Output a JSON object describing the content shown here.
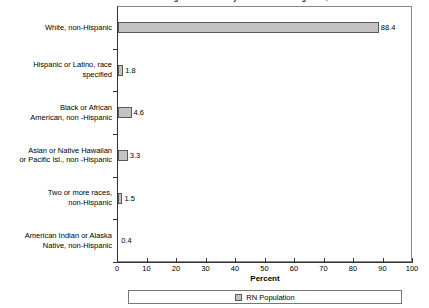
{
  "chart_data": {
    "type": "bar",
    "orientation": "horizontal",
    "title": "Registered Nurses by Racial/Ethnic Background, March 2004",
    "categories": [
      "White, non-Hispanic",
      "Hispanic or Latino, race specified",
      "Black or African American, non -Hispanic",
      "Asian or Native Hawaiian or Pacific Isl., non -Hispanic",
      "Two or more races, non-Hispanic",
      "American Indian or Alaska Native, non-Hispanic"
    ],
    "values": [
      88.4,
      1.8,
      4.6,
      3.3,
      1.5,
      0.4
    ],
    "value_labels": [
      "88.4",
      "1.8",
      "4.6",
      "3.3",
      "1.5",
      "0.4"
    ],
    "xlabel": "Percent",
    "ylabel": "",
    "xlim": [
      0,
      100
    ],
    "xticks": [
      0,
      10,
      20,
      30,
      40,
      50,
      60,
      70,
      80,
      90,
      100
    ],
    "xtick_labels": [
      "0",
      "10",
      "20",
      "30",
      "40",
      "50",
      "60",
      "70",
      "80",
      "90",
      "100"
    ],
    "grid": false,
    "legend": {
      "position": "bottom",
      "entries": [
        {
          "label": "RN Population",
          "color": "#c3c3c3"
        }
      ]
    },
    "series": [
      {
        "name": "RN Population",
        "color": "#c3c3c3",
        "values": [
          88.4,
          1.8,
          4.6,
          3.3,
          1.5,
          0.4
        ]
      }
    ]
  },
  "category_label_lines": [
    [
      "White, non-Hispanic"
    ],
    [
      "Hispanic or Latino, race",
      "specified"
    ],
    [
      "Black or African",
      "American, non -Hispanic"
    ],
    [
      "Asian or Native Hawaiian",
      "or Pacific Isl., non -Hispanic"
    ],
    [
      "Two or more races,",
      "non-Hispanic"
    ],
    [
      "American Indian or Alaska",
      "Native, non-Hispanic"
    ]
  ]
}
